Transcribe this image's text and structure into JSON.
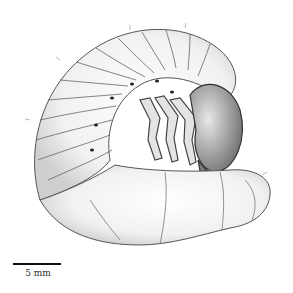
{
  "figure": {
    "style": "pencil/ink stippled scientific illustration",
    "colors": {
      "ink": "#333333",
      "background": "#ffffff",
      "scale_bar": "#111111"
    }
  },
  "scale_bar": {
    "label": "5 mm"
  }
}
